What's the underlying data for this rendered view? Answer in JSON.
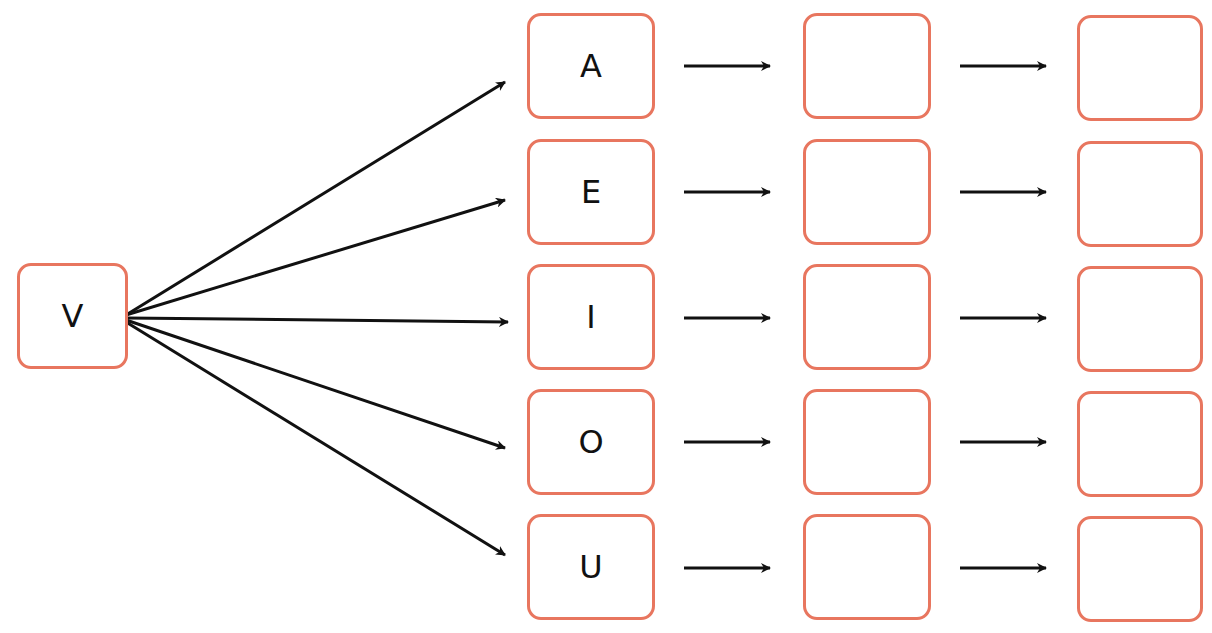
{
  "diagram": {
    "source": {
      "label": "V"
    },
    "rows": [
      {
        "letter": "A",
        "step2": "",
        "step3": ""
      },
      {
        "letter": "E",
        "step2": "",
        "step3": ""
      },
      {
        "letter": "I",
        "step2": "",
        "step3": ""
      },
      {
        "letter": "O",
        "step2": "",
        "step3": ""
      },
      {
        "letter": "U",
        "step2": "",
        "step3": ""
      }
    ],
    "colors": {
      "box_border": "#e8765f",
      "arrow": "#111111"
    }
  }
}
